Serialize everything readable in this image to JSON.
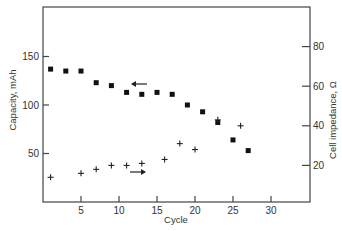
{
  "chart_data": {
    "type": "scatter",
    "title": "",
    "xlabel": "Cycle",
    "ylabel": "Capacity, mAh",
    "y2label": "Cell impedance, Ω",
    "xlim": [
      0,
      35
    ],
    "ylim": [
      0,
      200
    ],
    "y2lim": [
      0,
      100
    ],
    "x_ticks": [
      5,
      10,
      15,
      20,
      25,
      30
    ],
    "y_ticks": [
      50,
      100,
      150
    ],
    "y2_ticks": [
      20,
      40,
      60,
      80
    ],
    "grid": false,
    "legend": "none (arrows indicate axis for each series)",
    "series": [
      {
        "name": "Capacity",
        "marker": "filled-square",
        "axis": "left",
        "arrow": "left",
        "x": [
          1,
          3,
          5,
          7,
          9,
          11,
          13,
          15,
          17,
          19,
          21,
          23,
          25,
          27
        ],
        "y": [
          137,
          135,
          135,
          123,
          120,
          113,
          111,
          113,
          111,
          100,
          93,
          82,
          64,
          53
        ]
      },
      {
        "name": "Cell impedance",
        "marker": "plus",
        "axis": "right",
        "arrow": "right",
        "x": [
          1,
          5,
          7,
          9,
          11,
          13,
          16,
          18,
          20,
          23,
          26
        ],
        "y": [
          14,
          16,
          18,
          20,
          20,
          21,
          23,
          31,
          28,
          43,
          40
        ]
      }
    ]
  },
  "labels": {
    "xlabel": "Cycle",
    "ylabel": "Capacity, mAh",
    "y2label": "Cell impedance, Ω"
  }
}
